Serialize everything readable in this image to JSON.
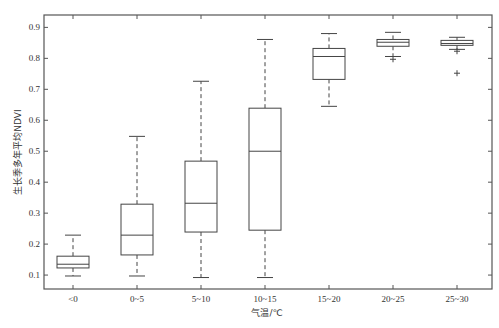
{
  "chart_data": {
    "type": "box",
    "title": "",
    "xlabel": "气温/℃",
    "ylabel": "生长季多年平均NDVI",
    "ylim": [
      0.055,
      0.94
    ],
    "yticks": [
      0.1,
      0.2,
      0.3,
      0.4,
      0.5,
      0.6,
      0.7,
      0.8,
      0.9
    ],
    "ytick_labels": [
      "0.1",
      "0.2",
      "0.3",
      "0.4",
      "0.5",
      "0.6",
      "0.7",
      "0.8",
      "0.9"
    ],
    "grid": false,
    "categories": [
      "<0",
      "0~5",
      "5~10",
      "10~15",
      "15~20",
      "20~25",
      "25~30"
    ],
    "boxes": [
      {
        "category": "<0",
        "whisker_low": 0.097,
        "q1": 0.123,
        "median": 0.135,
        "q3": 0.161,
        "whisker_high": 0.229,
        "outliers": []
      },
      {
        "category": "0~5",
        "whisker_low": 0.097,
        "q1": 0.165,
        "median": 0.229,
        "q3": 0.329,
        "whisker_high": 0.548,
        "outliers": []
      },
      {
        "category": "5~10",
        "whisker_low": 0.092,
        "q1": 0.239,
        "median": 0.332,
        "q3": 0.468,
        "whisker_high": 0.726,
        "outliers": []
      },
      {
        "category": "10~15",
        "whisker_low": 0.092,
        "q1": 0.245,
        "median": 0.5,
        "q3": 0.639,
        "whisker_high": 0.861,
        "outliers": []
      },
      {
        "category": "15~20",
        "whisker_low": 0.645,
        "q1": 0.732,
        "median": 0.806,
        "q3": 0.832,
        "whisker_high": 0.88,
        "outliers": []
      },
      {
        "category": "20~25",
        "whisker_low": 0.806,
        "q1": 0.839,
        "median": 0.852,
        "q3": 0.861,
        "whisker_high": 0.884,
        "outliers": [
          0.797
        ]
      },
      {
        "category": "25~30",
        "whisker_low": 0.829,
        "q1": 0.842,
        "median": 0.848,
        "q3": 0.858,
        "whisker_high": 0.868,
        "outliers": [
          0.823,
          0.752
        ]
      }
    ],
    "colors": {
      "line": "#444444",
      "axis": "#555555",
      "text": "#333333"
    }
  }
}
